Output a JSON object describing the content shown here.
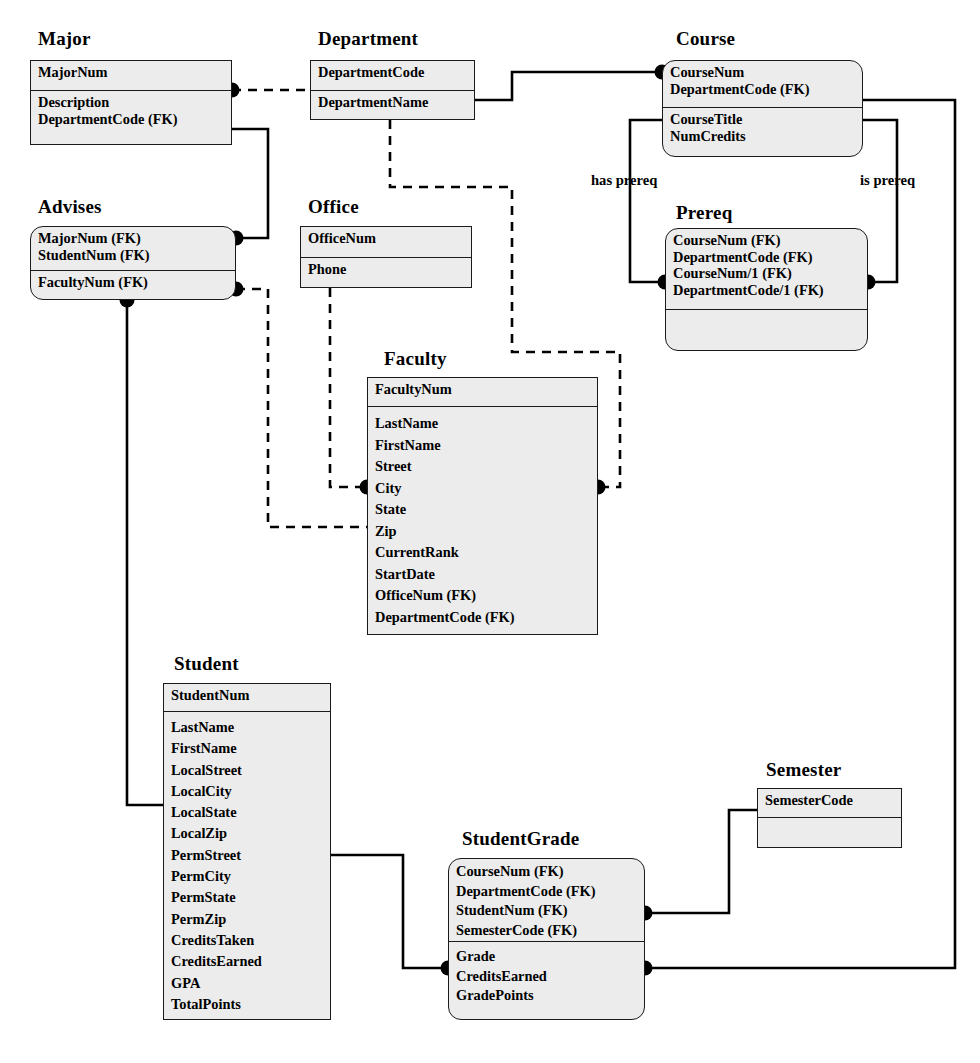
{
  "diagram": {
    "style": {
      "entity_fill": "#ececec",
      "entity_border": "#1a1a1a",
      "line_color": "#000000",
      "page_bg": "#ffffff"
    }
  },
  "entities": [
    {
      "id": "major",
      "name": "Major",
      "shape": "rectangle",
      "keys": [
        "MajorNum"
      ],
      "attributes": [
        "Description",
        "DepartmentCode (FK)"
      ]
    },
    {
      "id": "department",
      "name": "Department",
      "shape": "rectangle",
      "keys": [
        "DepartmentCode"
      ],
      "attributes": [
        "DepartmentName"
      ]
    },
    {
      "id": "course",
      "name": "Course",
      "shape": "rounded",
      "keys": [
        "CourseNum",
        "DepartmentCode (FK)"
      ],
      "attributes": [
        "CourseTitle",
        "NumCredits"
      ]
    },
    {
      "id": "advises",
      "name": "Advises",
      "shape": "rounded",
      "keys": [
        "MajorNum (FK)",
        "StudentNum (FK)"
      ],
      "attributes": [
        "FacultyNum (FK)"
      ]
    },
    {
      "id": "office",
      "name": "Office",
      "shape": "rectangle",
      "keys": [
        "OfficeNum"
      ],
      "attributes": [
        "Phone"
      ]
    },
    {
      "id": "prereq",
      "name": "Prereq",
      "shape": "rounded",
      "keys": [
        "CourseNum (FK)",
        "DepartmentCode (FK)",
        "CourseNum/1 (FK)",
        "DepartmentCode/1 (FK)"
      ],
      "attributes": []
    },
    {
      "id": "faculty",
      "name": "Faculty",
      "shape": "rectangle",
      "keys": [
        "FacultyNum"
      ],
      "attributes": [
        "LastName",
        "FirstName",
        "Street",
        "City",
        "State",
        "Zip",
        "CurrentRank",
        "StartDate",
        "OfficeNum (FK)",
        "DepartmentCode (FK)"
      ]
    },
    {
      "id": "student",
      "name": "Student",
      "shape": "rectangle",
      "keys": [
        "StudentNum"
      ],
      "attributes": [
        "LastName",
        "FirstName",
        "LocalStreet",
        "LocalCity",
        "LocalState",
        "LocalZip",
        "PermStreet",
        "PermCity",
        "PermState",
        "PermZip",
        "CreditsTaken",
        "CreditsEarned",
        "GPA",
        "TotalPoints"
      ]
    },
    {
      "id": "semester",
      "name": "Semester",
      "shape": "rectangle",
      "keys": [
        "SemesterCode"
      ],
      "attributes": []
    },
    {
      "id": "studentgrade",
      "name": "StudentGrade",
      "shape": "rounded",
      "keys": [
        "CourseNum (FK)",
        "DepartmentCode (FK)",
        "StudentNum (FK)",
        "SemesterCode (FK)"
      ],
      "attributes": [
        "Grade",
        "CreditsEarned",
        "GradePoints"
      ]
    }
  ],
  "relationship_labels": [
    {
      "id": "has-prereq",
      "text": "has prereq"
    },
    {
      "id": "is-prereq",
      "text": "is prereq"
    }
  ]
}
